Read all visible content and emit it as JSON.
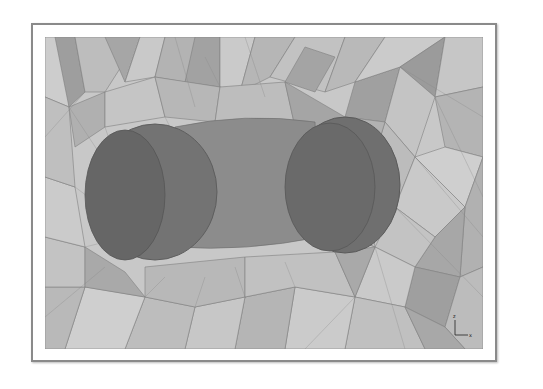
{
  "figure": {
    "colors": {
      "background": "#ffffff",
      "frame_border": "#8a8a8a",
      "mesh_light": "#cfcfcf",
      "mesh_mid": "#b0b0b0",
      "mesh_dark": "#9a9a9a",
      "body": "#6e6e6e",
      "body_dark": "#5a5a5a",
      "edge": "#7f7f7f"
    },
    "axis_triad": {
      "vertical_label": "z",
      "horizontal_label": "x"
    }
  }
}
